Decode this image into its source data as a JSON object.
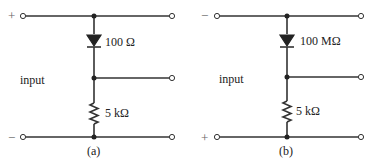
{
  "circuits": [
    {
      "id": "a",
      "caption": "(a)",
      "top_polarity": "+",
      "bottom_polarity": "−",
      "input_label": "input",
      "diode_label": "100 Ω",
      "resistor_label": "5 kΩ"
    },
    {
      "id": "b",
      "caption": "(b)",
      "top_polarity": "−",
      "bottom_polarity": "+",
      "input_label": "input",
      "diode_label": "100 MΩ",
      "resistor_label": "5 kΩ"
    }
  ],
  "colors": {
    "line": "#333333",
    "background": "#ffffff"
  }
}
